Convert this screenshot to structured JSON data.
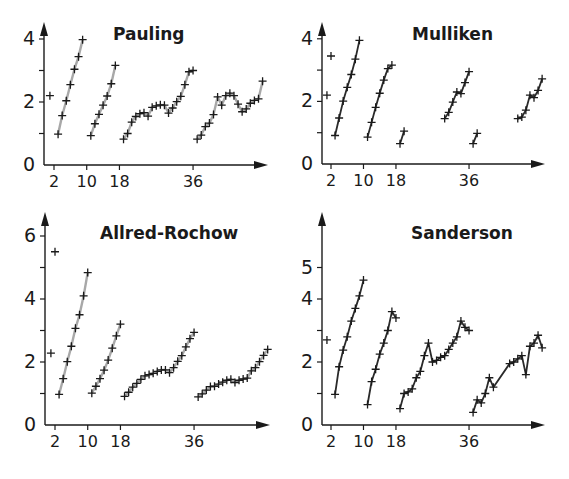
{
  "chart_data": [
    {
      "type": "line",
      "title": "Pauling",
      "xlabel": "",
      "ylabel": "",
      "ylim": [
        0,
        4.2
      ],
      "yticks": [
        0,
        1,
        2,
        3,
        4
      ],
      "ytick_labels": [
        "0",
        "",
        "2",
        "",
        "4"
      ],
      "xticks": [
        2,
        10,
        18,
        36
      ],
      "line_color": "#a8a8a8",
      "frame": {
        "x0": 44,
        "y0": 165,
        "px_per_z": 4.09,
        "z_origin": 2,
        "x_tick0": 54,
        "px_per_unit": 31.5,
        "x_end": 268,
        "y_top": 22
      },
      "series": [
        {
          "name": "H",
          "points": [
            [
              1,
              2.2
            ]
          ],
          "connected": false
        },
        {
          "name": "Period 2",
          "points": [
            [
              3,
              0.98
            ],
            [
              4,
              1.57
            ],
            [
              5,
              2.04
            ],
            [
              6,
              2.55
            ],
            [
              7,
              3.04
            ],
            [
              8,
              3.44
            ],
            [
              9,
              3.98
            ]
          ]
        },
        {
          "name": "Period 3",
          "points": [
            [
              11,
              0.93
            ],
            [
              12,
              1.31
            ],
            [
              13,
              1.61
            ],
            [
              14,
              1.9
            ],
            [
              15,
              2.19
            ],
            [
              16,
              2.58
            ],
            [
              17,
              3.16
            ]
          ]
        },
        {
          "name": "Period 4",
          "points": [
            [
              19,
              0.82
            ],
            [
              20,
              1.0
            ],
            [
              21,
              1.36
            ],
            [
              22,
              1.54
            ],
            [
              23,
              1.63
            ],
            [
              24,
              1.66
            ],
            [
              25,
              1.55
            ],
            [
              26,
              1.83
            ],
            [
              27,
              1.88
            ],
            [
              28,
              1.91
            ],
            [
              29,
              1.9
            ],
            [
              30,
              1.65
            ],
            [
              31,
              1.81
            ],
            [
              32,
              2.01
            ],
            [
              33,
              2.18
            ],
            [
              34,
              2.55
            ],
            [
              35,
              2.96
            ],
            [
              36,
              3.0
            ]
          ]
        },
        {
          "name": "Period 5",
          "points": [
            [
              37,
              0.82
            ],
            [
              38,
              0.95
            ],
            [
              39,
              1.22
            ],
            [
              40,
              1.33
            ],
            [
              41,
              1.6
            ],
            [
              42,
              2.16
            ],
            [
              43,
              1.9
            ],
            [
              44,
              2.2
            ],
            [
              45,
              2.28
            ],
            [
              46,
              2.2
            ],
            [
              47,
              1.93
            ],
            [
              48,
              1.69
            ],
            [
              49,
              1.78
            ],
            [
              50,
              1.96
            ],
            [
              51,
              2.05
            ],
            [
              52,
              2.1
            ],
            [
              53,
              2.66
            ]
          ]
        }
      ]
    },
    {
      "type": "line",
      "title": "Mulliken",
      "xlabel": "",
      "ylabel": "",
      "ylim": [
        0,
        4.2
      ],
      "yticks": [
        0,
        1,
        2,
        3,
        4
      ],
      "ytick_labels": [
        "0",
        "",
        "2",
        "",
        "4"
      ],
      "xticks": [
        2,
        10,
        18,
        36
      ],
      "line_color": "#2a2a2a",
      "frame": {
        "x0": 322,
        "y0": 164,
        "px_per_z": 4.06,
        "z_origin": 2,
        "x_tick0": 331,
        "px_per_unit": 31.3,
        "x_end": 545,
        "y_top": 22
      },
      "series": [
        {
          "name": "H",
          "points": [
            [
              1,
              2.2
            ]
          ],
          "connected": false
        },
        {
          "name": "He",
          "points": [
            [
              2,
              3.45
            ]
          ],
          "connected": false
        },
        {
          "name": "Period 2",
          "points": [
            [
              3,
              0.91
            ],
            [
              4,
              1.47
            ],
            [
              5,
              2.01
            ],
            [
              6,
              2.45
            ],
            [
              7,
              2.86
            ],
            [
              8,
              3.35
            ],
            [
              9,
              3.95
            ]
          ]
        },
        {
          "name": "Period 3 (main)",
          "points": [
            [
              11,
              0.86
            ],
            [
              12,
              1.33
            ],
            [
              13,
              1.81
            ],
            [
              14,
              2.26
            ],
            [
              15,
              2.68
            ],
            [
              16,
              3.05
            ],
            [
              17,
              3.16
            ]
          ]
        },
        {
          "name": "Period 4 s-block",
          "points": [
            [
              19,
              0.65
            ],
            [
              20,
              1.05
            ]
          ]
        },
        {
          "name": "Period 4 p-block",
          "points": [
            [
              30,
              1.45
            ],
            [
              31,
              1.65
            ],
            [
              32,
              1.98
            ],
            [
              33,
              2.3
            ],
            [
              34,
              2.25
            ],
            [
              35,
              2.6
            ],
            [
              36,
              2.95
            ]
          ]
        },
        {
          "name": "Period 5 s-block",
          "points": [
            [
              37,
              0.65
            ],
            [
              38,
              0.98
            ]
          ]
        },
        {
          "name": "Period 5 p-block",
          "points": [
            [
              48,
              1.45
            ],
            [
              49,
              1.5
            ],
            [
              50,
              1.72
            ],
            [
              51,
              2.2
            ],
            [
              52,
              2.12
            ],
            [
              53,
              2.35
            ],
            [
              54,
              2.72
            ]
          ]
        }
      ]
    },
    {
      "type": "line",
      "title": "Allred-Rochow",
      "xlabel": "",
      "ylabel": "",
      "ylim": [
        0,
        6.5
      ],
      "yticks": [
        0,
        1,
        2,
        3,
        4,
        5,
        6
      ],
      "ytick_labels": [
        "0",
        "",
        "2",
        "",
        "4",
        "",
        "6"
      ],
      "xticks": [
        2,
        10,
        18,
        36
      ],
      "line_color": "#a8a8a8",
      "frame": {
        "x0": 45,
        "y0": 425,
        "px_per_z": 4.09,
        "z_origin": 2,
        "x_tick0": 55,
        "px_per_unit": 31.5,
        "x_end": 270,
        "y_top": 212
      },
      "series": [
        {
          "name": "H",
          "points": [
            [
              1,
              2.28
            ]
          ],
          "connected": false
        },
        {
          "name": "He",
          "points": [
            [
              2,
              5.5
            ]
          ],
          "connected": false
        },
        {
          "name": "Period 2",
          "points": [
            [
              3,
              0.97
            ],
            [
              4,
              1.47
            ],
            [
              5,
              2.01
            ],
            [
              6,
              2.5
            ],
            [
              7,
              3.07
            ],
            [
              8,
              3.5
            ],
            [
              9,
              4.1
            ],
            [
              10,
              4.84
            ]
          ]
        },
        {
          "name": "Period 3",
          "points": [
            [
              11,
              1.01
            ],
            [
              12,
              1.23
            ],
            [
              13,
              1.47
            ],
            [
              14,
              1.74
            ],
            [
              15,
              2.06
            ],
            [
              16,
              2.44
            ],
            [
              17,
              2.83
            ],
            [
              18,
              3.2
            ]
          ]
        },
        {
          "name": "Period 4",
          "points": [
            [
              19,
              0.91
            ],
            [
              20,
              1.04
            ],
            [
              21,
              1.2
            ],
            [
              22,
              1.32
            ],
            [
              23,
              1.45
            ],
            [
              24,
              1.56
            ],
            [
              25,
              1.6
            ],
            [
              26,
              1.64
            ],
            [
              27,
              1.7
            ],
            [
              28,
              1.75
            ],
            [
              29,
              1.75
            ],
            [
              30,
              1.66
            ],
            [
              31,
              1.82
            ],
            [
              32,
              2.02
            ],
            [
              33,
              2.2
            ],
            [
              34,
              2.48
            ],
            [
              35,
              2.74
            ],
            [
              36,
              2.94
            ]
          ]
        },
        {
          "name": "Period 5",
          "points": [
            [
              37,
              0.89
            ],
            [
              38,
              0.99
            ],
            [
              39,
              1.11
            ],
            [
              40,
              1.22
            ],
            [
              41,
              1.23
            ],
            [
              42,
              1.3
            ],
            [
              43,
              1.36
            ],
            [
              44,
              1.42
            ],
            [
              45,
              1.45
            ],
            [
              46,
              1.35
            ],
            [
              47,
              1.42
            ],
            [
              48,
              1.46
            ],
            [
              49,
              1.49
            ],
            [
              50,
              1.72
            ],
            [
              51,
              1.82
            ],
            [
              52,
              2.01
            ],
            [
              53,
              2.21
            ],
            [
              54,
              2.4
            ]
          ]
        }
      ]
    },
    {
      "type": "line",
      "title": "Sanderson",
      "xlabel": "",
      "ylabel": "",
      "ylim": [
        0,
        6.5
      ],
      "yticks": [
        0,
        1,
        2,
        3,
        4,
        5
      ],
      "ytick_labels": [
        "0",
        "",
        "2",
        "",
        "4",
        "5"
      ],
      "xticks": [
        2,
        10,
        18,
        36
      ],
      "line_color": "#2a2a2a",
      "frame": {
        "x0": 322,
        "y0": 425,
        "px_per_z": 4.06,
        "z_origin": 2,
        "x_tick0": 331,
        "px_per_unit": 31.5,
        "x_end": 545,
        "y_top": 212
      },
      "series": [
        {
          "name": "H",
          "points": [
            [
              1,
              2.7
            ]
          ],
          "connected": false
        },
        {
          "name": "Period 2",
          "points": [
            [
              3,
              0.97
            ],
            [
              4,
              1.85
            ],
            [
              5,
              2.38
            ],
            [
              6,
              2.8
            ],
            [
              7,
              3.3
            ],
            [
              8,
              3.7
            ],
            [
              9,
              4.1
            ],
            [
              10,
              4.6
            ]
          ]
        },
        {
          "name": "Period 3",
          "points": [
            [
              11,
              0.65
            ],
            [
              12,
              1.38
            ],
            [
              13,
              1.77
            ],
            [
              14,
              2.25
            ],
            [
              15,
              2.6
            ],
            [
              16,
              3.0
            ],
            [
              17,
              3.6
            ],
            [
              18,
              3.4
            ]
          ]
        },
        {
          "name": "Period 4",
          "points": [
            [
              19,
              0.52
            ],
            [
              20,
              1.0
            ],
            [
              21,
              1.05
            ],
            [
              22,
              1.15
            ],
            [
              23,
              1.5
            ],
            [
              24,
              1.7
            ],
            [
              25,
              2.2
            ],
            [
              26,
              2.6
            ],
            [
              27,
              2.0
            ],
            [
              28,
              2.05
            ],
            [
              29,
              2.15
            ],
            [
              30,
              2.2
            ],
            [
              31,
              2.4
            ],
            [
              32,
              2.6
            ],
            [
              33,
              2.8
            ],
            [
              34,
              3.3
            ],
            [
              35,
              3.1
            ],
            [
              36,
              3.0
            ]
          ]
        },
        {
          "name": "Period 5",
          "points": [
            [
              37,
              0.4
            ],
            [
              38,
              0.8
            ],
            [
              39,
              0.7
            ],
            [
              40,
              1.0
            ],
            [
              41,
              1.5
            ],
            [
              42,
              1.2
            ],
            [
              46,
              1.95
            ],
            [
              47,
              2.0
            ],
            [
              48,
              2.1
            ],
            [
              49,
              2.2
            ],
            [
              50,
              1.6
            ],
            [
              51,
              2.5
            ],
            [
              52,
              2.6
            ],
            [
              53,
              2.85
            ],
            [
              54,
              2.45
            ]
          ]
        }
      ]
    }
  ]
}
